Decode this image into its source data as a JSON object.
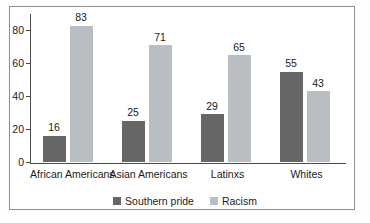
{
  "chart_data": {
    "type": "bar",
    "title": "",
    "xlabel": "",
    "ylabel": "",
    "ylim": [
      0,
      90
    ],
    "yticks": [
      0,
      20,
      40,
      60,
      80
    ],
    "grid": false,
    "legend_position": "bottom-center",
    "categories": [
      "African Americans",
      "Asian Americans",
      "Latinxs",
      "Whites"
    ],
    "series": [
      {
        "name": "Southern pride",
        "color": "#666666",
        "values": [
          16,
          25,
          29,
          55
        ]
      },
      {
        "name": "Racism",
        "color": "#b9bec3",
        "values": [
          83,
          71,
          65,
          43
        ]
      }
    ],
    "data_labels": {
      "southern_pride": [
        "16",
        "25",
        "29",
        "55"
      ],
      "racism": [
        "83",
        "71",
        "65",
        "43"
      ]
    },
    "ytick_labels": [
      "0",
      "20",
      "40",
      "60",
      "80"
    ]
  },
  "legend": {
    "items": [
      {
        "label": "Southern pride",
        "color": "#666666"
      },
      {
        "label": "Racism",
        "color": "#b9bec3"
      }
    ]
  }
}
